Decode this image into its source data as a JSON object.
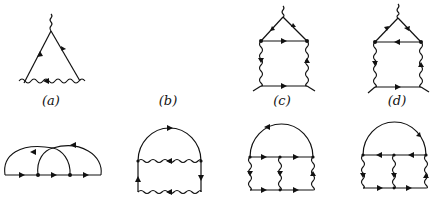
{
  "figure": {
    "cropped_caption_fragment": "",
    "top_row": [
      {
        "label": "(a)",
        "description": "triangle vertex with wavy photon line at bottom and external wavy leg at top"
      },
      {
        "label": "(b)",
        "description": "empty panel"
      },
      {
        "label": "(c)",
        "description": "triangle on box with wavy vertical sides, arrows clockwise"
      },
      {
        "label": "(d)",
        "description": "triangle on box with wavy vertical sides, arrows reversed"
      }
    ],
    "bottom_row": [
      {
        "label": "",
        "description": "two overlapping wavy arcs over straight fermion line with two vertices"
      },
      {
        "label": "",
        "description": "semicircle fermion loop over two wavy rungs"
      },
      {
        "label": "",
        "description": "semicircle over ladder with three wavy verticals, arrows right"
      },
      {
        "label": "",
        "description": "semicircle over ladder with three wavy verticals, arrows left/right"
      }
    ],
    "colors": {
      "ink": "#111111",
      "background": "#ffffff"
    }
  }
}
